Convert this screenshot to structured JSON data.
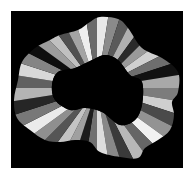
{
  "image": {
    "description": "Abstract grayscale artwork: black square containing a wavy ring composed of radial gray wedges around a black irregular center",
    "background_color": "#ffffff",
    "square_color": "#000000",
    "square": {
      "x": 11,
      "y": 11,
      "w": 172,
      "h": 157
    },
    "center": {
      "x": 97,
      "y": 88
    },
    "outer_path": [
      [
        100,
        17
      ],
      [
        118,
        19
      ],
      [
        128,
        28
      ],
      [
        142,
        48
      ],
      [
        162,
        58
      ],
      [
        178,
        72
      ],
      [
        178,
        92
      ],
      [
        172,
        102
      ],
      [
        174,
        115
      ],
      [
        170,
        130
      ],
      [
        158,
        140
      ],
      [
        145,
        148
      ],
      [
        138,
        158
      ],
      [
        120,
        157
      ],
      [
        100,
        152
      ],
      [
        90,
        142
      ],
      [
        75,
        140
      ],
      [
        60,
        142
      ],
      [
        45,
        140
      ],
      [
        30,
        130
      ],
      [
        17,
        118
      ],
      [
        14,
        100
      ],
      [
        18,
        80
      ],
      [
        22,
        62
      ],
      [
        35,
        48
      ],
      [
        50,
        40
      ],
      [
        60,
        35
      ],
      [
        78,
        30
      ],
      [
        90,
        22
      ]
    ],
    "inner_path": [
      [
        105,
        55
      ],
      [
        118,
        60
      ],
      [
        130,
        75
      ],
      [
        142,
        82
      ],
      [
        142,
        105
      ],
      [
        135,
        120
      ],
      [
        120,
        125
      ],
      [
        102,
        112
      ],
      [
        85,
        108
      ],
      [
        70,
        110
      ],
      [
        55,
        100
      ],
      [
        52,
        85
      ],
      [
        58,
        72
      ],
      [
        75,
        68
      ],
      [
        92,
        60
      ]
    ],
    "wedge_grays": [
      "#e8e8e8",
      "#8a8a8a",
      "#5a5a5a",
      "#b0b0b0",
      "#2a2a2a",
      "#9a9a9a",
      "#d0d0d0",
      "#6e6e6e",
      "#111111",
      "#a8a8a8",
      "#7c7c7c",
      "#cfcfcf",
      "#4a4a4a",
      "#939393",
      "#f2f2f2",
      "#666666",
      "#b8b8b8",
      "#3a3a3a",
      "#888888",
      "#dddddd",
      "#707070",
      "#1c1c1c",
      "#a0a0a0",
      "#c4c4c4",
      "#555555",
      "#8f8f8f",
      "#ebebeb",
      "#787878",
      "#262626",
      "#b4b4b4",
      "#606060",
      "#d8d8d8",
      "#848484",
      "#0e0e0e",
      "#9c9c9c",
      "#c0c0c0",
      "#505050",
      "#a4a4a4",
      "#eeeeee",
      "#6a6a6a"
    ]
  }
}
